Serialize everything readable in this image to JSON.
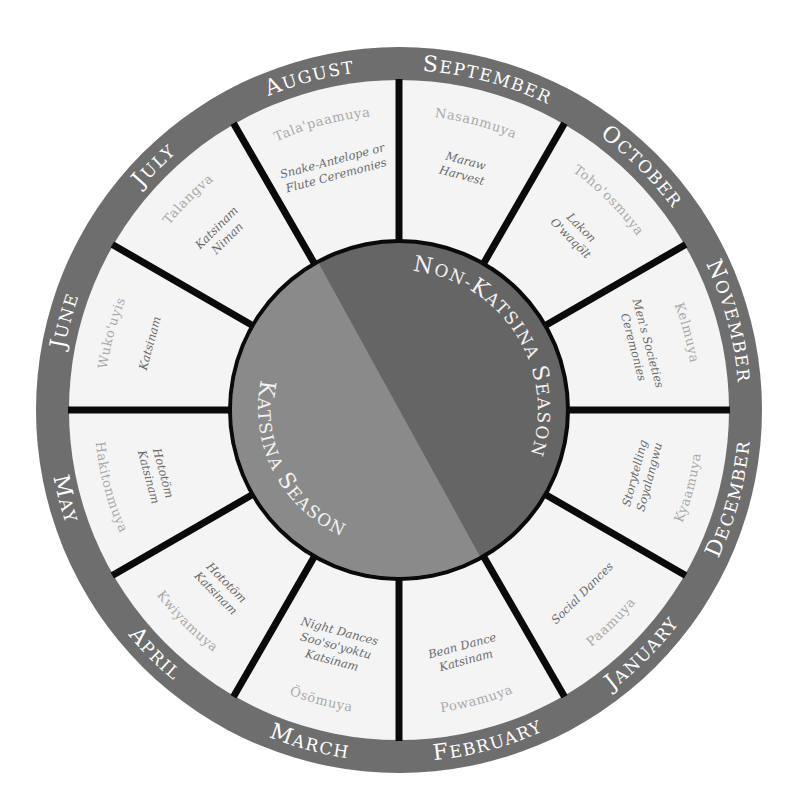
{
  "colors": {
    "outer_ring": "#6e6e6e",
    "segment_fill": "#f4f4f4",
    "spokes": "#0a0a0a",
    "katsina_season": "#8a8a8a",
    "non_katsina_season": "#656565",
    "month_text": "#ffffff",
    "hopi_text": "#a9a9a9",
    "event_text": "#6a6a6a"
  },
  "seasons": {
    "katsina": "Katsina Season",
    "non_katsina": "Non-Katsina Season"
  },
  "months": [
    {
      "name": "September",
      "hopi": "Nasanmuya",
      "events": [
        "Maraw",
        "Harvest"
      ]
    },
    {
      "name": "October",
      "hopi": "Toho'osmuya",
      "events": [
        "Lakon",
        "O'waqölt"
      ]
    },
    {
      "name": "November",
      "hopi": "Kelmuya",
      "events": [
        "Men's Societies",
        "Ceremonies"
      ]
    },
    {
      "name": "December",
      "hopi": "Kyaamuya",
      "events": [
        "Storytelling",
        "Soyalangwu"
      ]
    },
    {
      "name": "January",
      "hopi": "Paamuya",
      "events": [
        "Social Dances"
      ]
    },
    {
      "name": "February",
      "hopi": "Powamuya",
      "events": [
        "Bean Dance",
        "Katsinam"
      ]
    },
    {
      "name": "March",
      "hopi": "Ösömuya",
      "events": [
        "Night Dances",
        "Soo'so'yoktu",
        "Katsinam"
      ]
    },
    {
      "name": "April",
      "hopi": "Kwiyamuya",
      "events": [
        "Hototöm",
        "Katsinam"
      ]
    },
    {
      "name": "May",
      "hopi": "Hakitonmuya",
      "events": [
        "Hototöm",
        "Katsinam"
      ]
    },
    {
      "name": "June",
      "hopi": "Wuko'uyis",
      "events": [
        "Katsinam"
      ]
    },
    {
      "name": "July",
      "hopi": "Talangva",
      "events": [
        "Katsinam",
        "Niman"
      ]
    },
    {
      "name": "August",
      "hopi": "Tala'paamuya",
      "events": [
        "Snake-Antelope or",
        "Flute Ceremonies"
      ]
    }
  ]
}
